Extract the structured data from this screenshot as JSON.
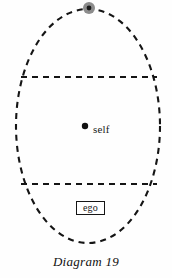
{
  "figure": {
    "caption": "Diagram 19",
    "background_color": "#fefefe",
    "ink_color": "#151515",
    "width": 172,
    "height": 278
  },
  "diagram": {
    "type": "schematic",
    "outer_boundary": {
      "name": "psyche-ellipse",
      "shape": "ellipse",
      "stroke": "dashed",
      "center": [
        88,
        126
      ],
      "rx": 72,
      "ry": 117,
      "stroke_color": "#151515",
      "stroke_width": 2.1,
      "dash": "6 5"
    },
    "divider_lines": [
      {
        "name": "upper-divider",
        "stroke": "dashed",
        "y": 77,
        "x1": 21,
        "x2": 157,
        "stroke_color": "#151515",
        "stroke_width": 2.0,
        "dash": "6 5"
      },
      {
        "name": "lower-divider",
        "stroke": "dashed",
        "y": 184,
        "x1": 21,
        "x2": 157,
        "stroke_color": "#151515",
        "stroke_width": 2.0,
        "dash": "6 5"
      }
    ],
    "markers": [
      {
        "name": "apex-marker",
        "shape": "circle",
        "cx": 89,
        "cy": 8,
        "r_outer": 6,
        "r_inner": 2.4,
        "fill_outer": "#8c8c8c",
        "fill_inner": "#1a1a1a",
        "label": ""
      },
      {
        "name": "self-point",
        "shape": "circle",
        "cx": 85,
        "cy": 126,
        "r_outer": 3.2,
        "fill_outer": "#111111",
        "label": "self"
      }
    ],
    "labels": {
      "self": "self",
      "ego": "ego"
    }
  }
}
